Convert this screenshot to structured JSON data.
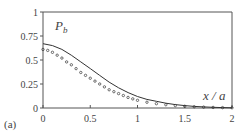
{
  "chart_data": {
    "type": "line",
    "title": "",
    "panel_label": "(a)",
    "xlabel": "x/a",
    "ylabel": "P_b",
    "xlim": [
      0,
      2
    ],
    "ylim": [
      0,
      1
    ],
    "x_ticks": [
      "0",
      "0.5",
      "1",
      "1.5",
      "2"
    ],
    "y_ticks": [
      "0",
      "0.25",
      "0.5",
      "0.75",
      "1"
    ],
    "grid": false,
    "legend": null,
    "series": [
      {
        "name": "solid curve",
        "style": "solid",
        "x": [
          0,
          0.1,
          0.2,
          0.3,
          0.4,
          0.5,
          0.6,
          0.7,
          0.8,
          0.9,
          1.0,
          1.1,
          1.2,
          1.3,
          1.4,
          1.5,
          1.6,
          1.7,
          1.8,
          1.9,
          2.0
        ],
        "values": [
          0.67,
          0.65,
          0.61,
          0.55,
          0.48,
          0.41,
          0.34,
          0.27,
          0.21,
          0.16,
          0.12,
          0.09,
          0.07,
          0.05,
          0.035,
          0.025,
          0.017,
          0.011,
          0.007,
          0.004,
          0.002
        ]
      },
      {
        "name": "markers",
        "style": "markers",
        "x": [
          0,
          0.05,
          0.1,
          0.15,
          0.2,
          0.25,
          0.3,
          0.35,
          0.4,
          0.45,
          0.5,
          0.55,
          0.6,
          0.65,
          0.7,
          0.75,
          0.8,
          0.85,
          0.9,
          0.95,
          1.0,
          1.1,
          1.2,
          1.3,
          1.4,
          1.5,
          1.6,
          1.7,
          1.8,
          1.9,
          2.0
        ],
        "values": [
          0.61,
          0.6,
          0.58,
          0.55,
          0.52,
          0.48,
          0.45,
          0.41,
          0.37,
          0.34,
          0.31,
          0.28,
          0.25,
          0.22,
          0.19,
          0.17,
          0.15,
          0.13,
          0.11,
          0.095,
          0.08,
          0.06,
          0.045,
          0.034,
          0.025,
          0.018,
          0.013,
          0.009,
          0.006,
          0.004,
          0.002
        ]
      }
    ]
  },
  "labels": {
    "panel": "(a)",
    "ylabel_main": "P",
    "ylabel_sub": "b",
    "xlabel": "x / a"
  }
}
